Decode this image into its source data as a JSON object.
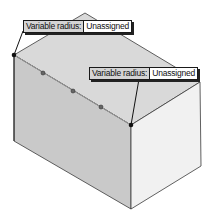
{
  "scene": {
    "description": "Isometric box with variable radius fillet edge selected",
    "colors": {
      "background": "#ffffff",
      "top_face": "#d9d9d9",
      "front_left_face": "#c9c9c9",
      "right_face": "#f1f1f1",
      "edge": "#3a3a3a",
      "point": "#111111",
      "control_point": "#555555"
    }
  },
  "callouts": [
    {
      "label": "Variable radius:",
      "value": "Unassigned"
    },
    {
      "label": "Variable radius:",
      "value": "Unassigned"
    }
  ]
}
